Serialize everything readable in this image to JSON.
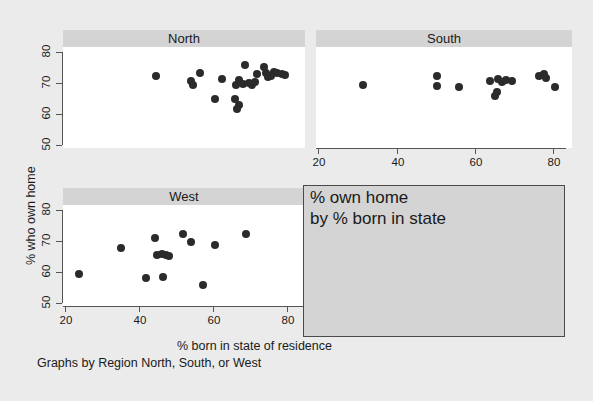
{
  "figure": {
    "ylabel": "% who own home",
    "xlabel": "% born in state of residence",
    "note": "Graphs by Region North, South, or West",
    "legend_line1": "% own home",
    "legend_line2": "by % born in state",
    "panel_header_color": "#d4d4d4",
    "background_color": "#ebebeb",
    "plot_background_color": "#ffffff",
    "marker_color": "#2b2b2b",
    "axis_color": "#555555"
  },
  "chart_data": {
    "type": "scatter",
    "title": "% own home by % born in state",
    "xlabel": "% born in state of residence",
    "ylabel": "% who own home",
    "xlim": [
      17,
      85
    ],
    "ylim": [
      48,
      82
    ],
    "xticks": [
      20,
      40,
      60,
      80
    ],
    "yticks": [
      50,
      60,
      70,
      80
    ],
    "grid": false,
    "legend": "panel headers",
    "panels": [
      {
        "name": "North",
        "position": "top-left",
        "points": [
          {
            "x": 44.5,
            "y": 72.2
          },
          {
            "x": 54.0,
            "y": 70.6
          },
          {
            "x": 54.6,
            "y": 69.2
          },
          {
            "x": 56.4,
            "y": 73.1
          },
          {
            "x": 62.3,
            "y": 71.4
          },
          {
            "x": 60.5,
            "y": 64.8
          },
          {
            "x": 68.6,
            "y": 75.9
          },
          {
            "x": 67.0,
            "y": 71.0
          },
          {
            "x": 66.2,
            "y": 69.4
          },
          {
            "x": 68.2,
            "y": 69.6
          },
          {
            "x": 69.8,
            "y": 70.1
          },
          {
            "x": 70.5,
            "y": 69.3
          },
          {
            "x": 71.4,
            "y": 70.4
          },
          {
            "x": 72.0,
            "y": 72.8
          },
          {
            "x": 73.8,
            "y": 75.3
          },
          {
            "x": 74.4,
            "y": 73.3
          },
          {
            "x": 74.9,
            "y": 71.8
          },
          {
            "x": 75.8,
            "y": 72.1
          },
          {
            "x": 76.6,
            "y": 73.6
          },
          {
            "x": 77.4,
            "y": 73.2
          },
          {
            "x": 78.6,
            "y": 73.0
          },
          {
            "x": 79.5,
            "y": 72.6
          },
          {
            "x": 66.0,
            "y": 64.9
          },
          {
            "x": 67.1,
            "y": 62.8
          },
          {
            "x": 66.6,
            "y": 61.6
          }
        ]
      },
      {
        "name": "South",
        "position": "top-right",
        "points": [
          {
            "x": 31.5,
            "y": 69.4
          },
          {
            "x": 50.3,
            "y": 72.3
          },
          {
            "x": 50.4,
            "y": 69.0
          },
          {
            "x": 56.0,
            "y": 68.8
          },
          {
            "x": 64.0,
            "y": 70.6
          },
          {
            "x": 66.0,
            "y": 71.4
          },
          {
            "x": 67.1,
            "y": 70.3
          },
          {
            "x": 68.0,
            "y": 71.0
          },
          {
            "x": 69.5,
            "y": 70.7
          },
          {
            "x": 65.6,
            "y": 67.1
          },
          {
            "x": 65.3,
            "y": 65.8
          },
          {
            "x": 76.5,
            "y": 72.3
          },
          {
            "x": 77.6,
            "y": 73.0
          },
          {
            "x": 78.2,
            "y": 71.6
          },
          {
            "x": 80.4,
            "y": 68.6
          }
        ]
      },
      {
        "name": "West",
        "position": "bottom-left",
        "points": [
          {
            "x": 23.8,
            "y": 59.4
          },
          {
            "x": 35.0,
            "y": 67.8
          },
          {
            "x": 42.0,
            "y": 58.2
          },
          {
            "x": 44.2,
            "y": 70.9
          },
          {
            "x": 44.8,
            "y": 65.6
          },
          {
            "x": 46.3,
            "y": 65.7
          },
          {
            "x": 47.4,
            "y": 65.6
          },
          {
            "x": 48.2,
            "y": 65.1
          },
          {
            "x": 46.5,
            "y": 58.5
          },
          {
            "x": 51.8,
            "y": 72.2
          },
          {
            "x": 54.0,
            "y": 69.8
          },
          {
            "x": 57.4,
            "y": 55.8
          },
          {
            "x": 60.5,
            "y": 68.8
          },
          {
            "x": 69.0,
            "y": 72.4
          }
        ]
      }
    ]
  },
  "panels": {
    "north": {
      "label": "North"
    },
    "south": {
      "label": "South"
    },
    "west": {
      "label": "West"
    }
  },
  "axes": {
    "y_tick_labels": [
      "80",
      "70",
      "60",
      "50"
    ],
    "x_tick_labels": [
      "20",
      "40",
      "60",
      "80"
    ]
  }
}
